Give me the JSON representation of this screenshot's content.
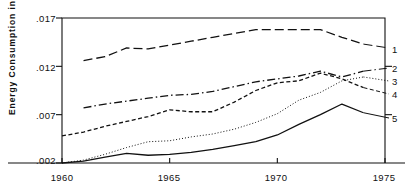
{
  "chart_data": {
    "type": "line",
    "title": "",
    "xlabel": "",
    "ylabel": "Energy Consumption in Tcals",
    "xlim": [
      1960,
      1975
    ],
    "ylim": [
      0.002,
      0.017
    ],
    "xticks": [
      "1960",
      "1965",
      "1970",
      "1975"
    ],
    "xtick_values": [
      1960,
      1965,
      1970,
      1975
    ],
    "yticks": [
      ".017",
      ".012",
      ".007",
      ".002"
    ],
    "ytick_values": [
      0.017,
      0.012,
      0.007,
      0.002
    ],
    "grid": false,
    "legend": "right-edge-line-labels",
    "series": [
      {
        "name": "1",
        "label": "1",
        "style": "long-dash",
        "x": [
          1961,
          1962,
          1963,
          1964,
          1965,
          1966,
          1967,
          1968,
          1969,
          1970,
          1971,
          1972,
          1973,
          1974
        ],
        "values": [
          0.0126,
          0.013,
          0.0139,
          0.0138,
          0.0142,
          0.0146,
          0.015,
          0.0154,
          0.0158,
          0.0158,
          0.0158,
          0.0158,
          0.015,
          0.0143
        ]
      },
      {
        "name": "2",
        "label": "2",
        "style": "dash-dot",
        "x": [
          1961,
          1962,
          1963,
          1964,
          1965,
          1966,
          1967,
          1968,
          1969,
          1970,
          1971,
          1972,
          1973,
          1974
        ],
        "values": [
          0.0077,
          0.0081,
          0.0084,
          0.0087,
          0.009,
          0.0091,
          0.0094,
          0.0099,
          0.0104,
          0.0107,
          0.011,
          0.0115,
          0.0109,
          0.0115
        ]
      },
      {
        "name": "3",
        "label": "3",
        "style": "dotted",
        "x": [
          1960,
          1961,
          1962,
          1963,
          1964,
          1965,
          1966,
          1967,
          1968,
          1969,
          1970,
          1971,
          1972,
          1973,
          1974
        ],
        "values": [
          0.002,
          0.0023,
          0.0029,
          0.0036,
          0.0042,
          0.0043,
          0.0047,
          0.005,
          0.0055,
          0.0062,
          0.0071,
          0.0085,
          0.0093,
          0.0105,
          0.0109
        ]
      },
      {
        "name": "4",
        "label": "4",
        "style": "short-dash",
        "x": [
          1960,
          1961,
          1962,
          1963,
          1964,
          1965,
          1966,
          1967,
          1968,
          1969,
          1970,
          1971,
          1972,
          1973,
          1974
        ],
        "values": [
          0.0048,
          0.0052,
          0.0058,
          0.0063,
          0.0068,
          0.0075,
          0.0073,
          0.0073,
          0.0083,
          0.0095,
          0.0103,
          0.0105,
          0.0113,
          0.0107,
          0.0098
        ]
      },
      {
        "name": "5",
        "label": "5",
        "style": "solid",
        "x": [
          1960,
          1961,
          1962,
          1963,
          1964,
          1965,
          1966,
          1967,
          1968,
          1969,
          1970,
          1971,
          1972,
          1973,
          1974
        ],
        "values": [
          0.002,
          0.0022,
          0.0026,
          0.003,
          0.0028,
          0.0029,
          0.0031,
          0.0034,
          0.0038,
          0.0042,
          0.0049,
          0.006,
          0.007,
          0.0081,
          0.0072
        ]
      }
    ],
    "colors": {
      "axis": "#111111",
      "line": "#111111",
      "background": "#ffffff"
    }
  },
  "axis": {
    "ylabel": "Energy Consumption in Tcals",
    "ytick_0": ".017",
    "ytick_1": ".012",
    "ytick_2": ".007",
    "ytick_3": ".002",
    "xtick_0": "1960",
    "xtick_1": "1965",
    "xtick_2": "1970",
    "xtick_3": "1975"
  },
  "series_labels": {
    "s1": "1",
    "s2": "2",
    "s3": "3",
    "s4": "4",
    "s5": "5"
  }
}
